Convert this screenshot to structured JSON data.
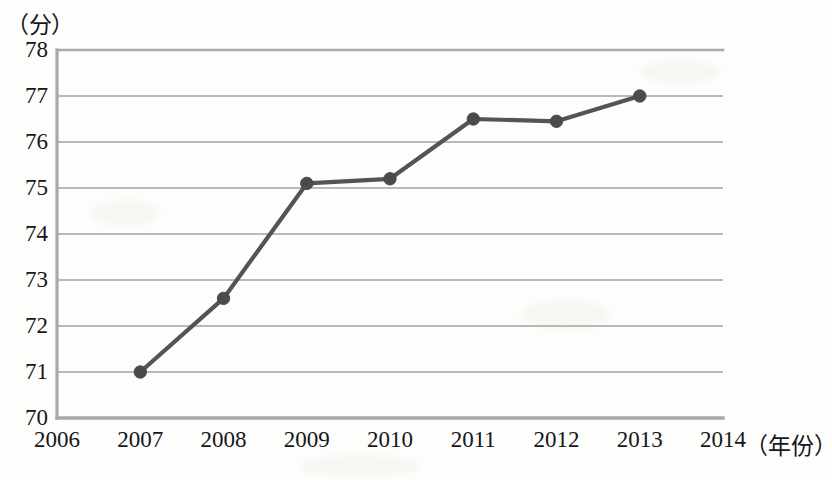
{
  "chart_data": {
    "type": "line",
    "title": "",
    "subtitle": "",
    "xlabel": "（年份）",
    "ylabel": "（分）",
    "categories": [
      2006,
      2007,
      2008,
      2009,
      2010,
      2011,
      2012,
      2013,
      2014
    ],
    "x_tick_labels": [
      "2006",
      "2007",
      "2008",
      "2009",
      "2010",
      "2011",
      "2012",
      "2013",
      "2014"
    ],
    "y_tick_labels": [
      "70",
      "71",
      "72",
      "73",
      "74",
      "75",
      "76",
      "77",
      "78"
    ],
    "y_ticks": [
      70,
      71,
      72,
      73,
      74,
      75,
      76,
      77,
      78
    ],
    "xlim": [
      2006,
      2014
    ],
    "ylim": [
      70,
      78
    ],
    "grid": true,
    "legend": false,
    "legend_position": "none",
    "series": [
      {
        "name": "得分",
        "x": [
          2007,
          2008,
          2009,
          2010,
          2011,
          2012,
          2013
        ],
        "values": [
          71.0,
          72.6,
          75.1,
          75.2,
          76.5,
          76.45,
          77.0
        ],
        "marker": "circle",
        "color": "#555453"
      }
    ],
    "annotations": []
  },
  "axes": {
    "y_unit_label": "（分）",
    "x_unit_label": "（年份）"
  },
  "style": {
    "line_color": "#555453",
    "marker_color": "#4c4b4a",
    "grid_color": "#b9b9b7",
    "frame_color": "#a9a9a7",
    "background": "#fdfdfb",
    "text_color": "#16161a"
  }
}
